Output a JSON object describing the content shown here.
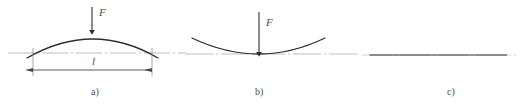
{
  "figure": {
    "width": 530,
    "height": 112,
    "background": "#ffffff",
    "colors": {
      "curve": "#2e2e2e",
      "axis": "#b9b9b9",
      "dimension": "#555555",
      "text": "#3a3a3a"
    }
  },
  "panels": [
    {
      "id": "a",
      "caption": "a)",
      "caption_x": 95,
      "caption_y": 88,
      "description": "convex arch bowed upward above centre line with downward point load and span dimension",
      "force_label": "F",
      "force_label_x": 99,
      "force_label_y": 7,
      "span_label": "l",
      "span_label_x": 92,
      "span_label_y": 57,
      "centerline": {
        "x1": 8,
        "x2": 186,
        "y": 53
      },
      "arc": {
        "x1": 27,
        "y1": 58,
        "cx": 93,
        "cy": 20,
        "x2": 158,
        "y2": 58
      },
      "arrow": {
        "x": 92,
        "y1": 7,
        "y2": 33
      },
      "dimension": {
        "x1": 33,
        "x2": 152,
        "y": 70,
        "ext_top": 48
      }
    },
    {
      "id": "b",
      "caption": "b)",
      "caption_x": 258,
      "caption_y": 88,
      "description": "concave curve sagging below centre line with downward point load",
      "force_label": "F",
      "force_label_x": 266,
      "force_label_y": 17,
      "centerline": {
        "x1": 185,
        "x2": 360,
        "y": 54
      },
      "arc": {
        "x1": 192,
        "y1": 38,
        "cx": 259,
        "cy": 70,
        "x2": 325,
        "y2": 38
      },
      "arrow": {
        "x": 259,
        "y1": 12,
        "y2": 55
      }
    },
    {
      "id": "c",
      "caption": "c)",
      "caption_x": 450,
      "caption_y": 88,
      "description": "straight undeformed line with no load",
      "line": {
        "x1": 370,
        "x2": 507,
        "y": 55
      },
      "centerline": {
        "x1": 362,
        "x2": 516,
        "y": 55
      }
    }
  ]
}
